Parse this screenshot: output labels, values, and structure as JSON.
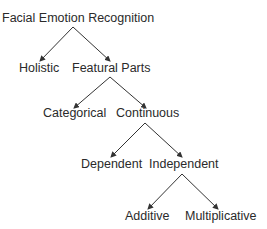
{
  "diagram": {
    "type": "tree",
    "title": "Facial Emotion Recognition",
    "line_color": "#333333",
    "text_color": "#2a2a2a",
    "nodes": {
      "root": "Facial Emotion Recognition",
      "holistic": "Holistic",
      "featural": "Featural Parts",
      "categorical": "Categorical",
      "continuous": "Continuous",
      "dependent": "Dependent",
      "independent": "Independent",
      "additive": "Additive",
      "multiplicative": "Multiplicative"
    },
    "edges": [
      [
        "Facial Emotion Recognition",
        "Holistic"
      ],
      [
        "Facial Emotion Recognition",
        "Featural Parts"
      ],
      [
        "Featural Parts",
        "Categorical"
      ],
      [
        "Featural Parts",
        "Continuous"
      ],
      [
        "Continuous",
        "Dependent"
      ],
      [
        "Continuous",
        "Independent"
      ],
      [
        "Independent",
        "Additive"
      ],
      [
        "Independent",
        "Multiplicative"
      ]
    ]
  }
}
